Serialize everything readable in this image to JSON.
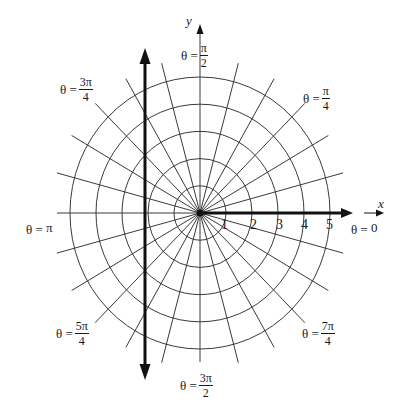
{
  "figure": {
    "center_px": [
      200,
      213
    ],
    "ring_radius_px_x": 26,
    "ring_radius_px_y": 27.2,
    "rings": [
      1,
      2,
      3,
      4,
      5
    ],
    "spoke_step_degrees": 15,
    "spoke_count": 24,
    "colors": {
      "grid": "#3a3a3a",
      "axis": "#111111",
      "background": "#ffffff"
    }
  },
  "axes": {
    "x_label": "x",
    "y_label": "y",
    "radial_ticks": [
      "1",
      "2",
      "3",
      "4",
      "5"
    ]
  },
  "angle_labels": {
    "zero": {
      "lhs": "θ =",
      "plain": "0"
    },
    "pi_over_4": {
      "lhs": "θ =",
      "num": "π",
      "den": "4"
    },
    "pi_over_2": {
      "lhs": "θ =",
      "num": "π",
      "den": "2"
    },
    "three_pi_4": {
      "lhs": "θ =",
      "num": "3π",
      "den": "4"
    },
    "pi": {
      "lhs": "θ =",
      "plain": "π"
    },
    "five_pi_4": {
      "lhs": "θ =",
      "num": "5π",
      "den": "4"
    },
    "three_pi_2": {
      "lhs": "θ =",
      "num": "3π",
      "den": "2"
    },
    "seven_pi_4": {
      "lhs": "θ =",
      "num": "7π",
      "den": "4"
    }
  }
}
